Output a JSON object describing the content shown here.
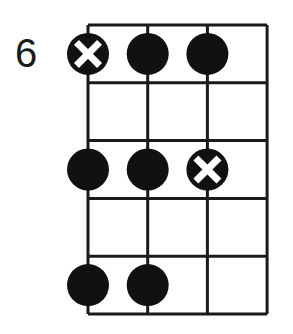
{
  "diagram": {
    "fret_label": "6",
    "strings": 4,
    "frets": 5,
    "grid": {
      "left": 88,
      "top": 25,
      "col_width": 59.7,
      "row_height": 57.8,
      "line_color": "#1a1a1a",
      "line_width": 3
    },
    "dot_radius": 21,
    "dot_color": "#111111",
    "dots": [
      {
        "string": 0,
        "fret": 0,
        "type": "root"
      },
      {
        "string": 1,
        "fret": 0,
        "type": "note"
      },
      {
        "string": 2,
        "fret": 0,
        "type": "note"
      },
      {
        "string": 0,
        "fret": 2,
        "type": "note"
      },
      {
        "string": 1,
        "fret": 2,
        "type": "note"
      },
      {
        "string": 2,
        "fret": 2,
        "type": "root"
      },
      {
        "string": 0,
        "fret": 4,
        "type": "note"
      },
      {
        "string": 1,
        "fret": 4,
        "type": "note"
      }
    ]
  }
}
